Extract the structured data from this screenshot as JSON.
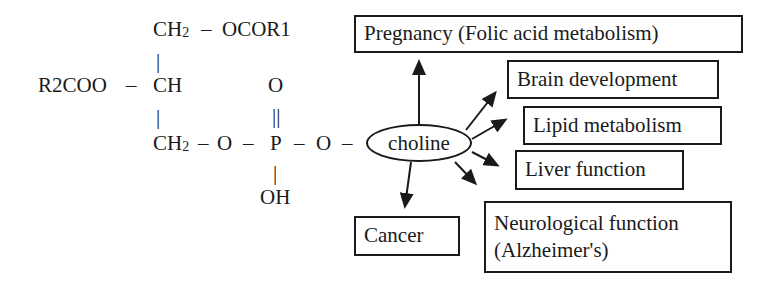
{
  "molecule": {
    "name": "phosphatidylcholine",
    "top_row": {
      "group": "CH",
      "subscript": "2",
      "bond": "–",
      "substituent": "OCOR1"
    },
    "middle_row": {
      "substituent": "R2COO",
      "bond": "–",
      "group": "CH"
    },
    "bottom_row": {
      "group": "CH",
      "subscript": "2",
      "chain": [
        "–",
        "O",
        "–",
        "P",
        "–",
        "O",
        "–"
      ]
    },
    "phosphate_double_bond_oxygen": "O",
    "double_bond": "||",
    "phosphate_hydroxyl": "OH",
    "single_bond_vertical": "|"
  },
  "center_node": {
    "label": "choline"
  },
  "targets": [
    {
      "id": "pregnancy",
      "label": "Pregnancy (Folic acid metabolism)"
    },
    {
      "id": "brain",
      "label": "Brain development"
    },
    {
      "id": "lipid",
      "label": "Lipid metabolism"
    },
    {
      "id": "liver",
      "label": "Liver function"
    },
    {
      "id": "cancer",
      "label": "Cancer"
    },
    {
      "id": "neuro",
      "label_line1": "Neurological function",
      "label_line2": "(Alzheimer's)"
    }
  ],
  "colors": {
    "ink": "#1a1a1a",
    "background": "#ffffff"
  }
}
